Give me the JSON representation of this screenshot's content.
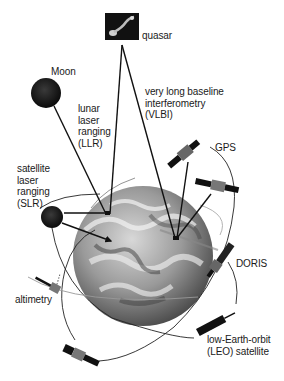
{
  "diagram": {
    "type": "space-geodesy-techniques",
    "background": "#ffffff",
    "line_color": "#111111",
    "labels": {
      "quasar": "quasar",
      "moon": "Moon",
      "llr": "lunar\nlaser\nranging\n(LLR)",
      "vlbi": "very long baseline\ninterferometry\n(VLBI)",
      "gps": "GPS",
      "slr": "satellite\nlaser\nranging\n(SLR)",
      "doris": "DORIS",
      "altimetry": "altimetry",
      "leo": "low-Earth-orbit\n(LEO) satellite"
    },
    "objects": [
      {
        "name": "quasar",
        "kind": "image-box"
      },
      {
        "name": "moon",
        "kind": "sphere"
      },
      {
        "name": "earth",
        "kind": "globe"
      },
      {
        "name": "slr-satellite",
        "kind": "sphere"
      },
      {
        "name": "gps-satellite-1",
        "kind": "satellite"
      },
      {
        "name": "gps-satellite-2",
        "kind": "satellite"
      },
      {
        "name": "doris-satellite",
        "kind": "satellite"
      },
      {
        "name": "altimetry-satellite",
        "kind": "satellite"
      },
      {
        "name": "leo-satellite",
        "kind": "satellite"
      },
      {
        "name": "bottom-satellite",
        "kind": "satellite"
      }
    ]
  }
}
